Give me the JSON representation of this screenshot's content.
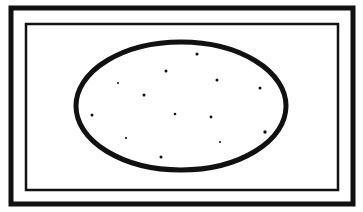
{
  "illustration": {
    "subject": "cracker-icon",
    "background": "#ffffff",
    "stroke_color": "#111111",
    "outer_frame": {
      "x": 11,
      "y": 8,
      "w": 342,
      "h": 196,
      "stroke": 5
    },
    "inner_frame": {
      "x": 26,
      "y": 24,
      "w": 312,
      "h": 166,
      "stroke": 2.5
    },
    "ellipse": {
      "cx": 181,
      "cy": 106,
      "rx": 105,
      "ry": 64,
      "stroke": 5
    },
    "dots": [
      {
        "x": 197,
        "y": 54,
        "r": 1.6
      },
      {
        "x": 166,
        "y": 71,
        "r": 1.5
      },
      {
        "x": 217,
        "y": 80,
        "r": 1.5
      },
      {
        "x": 118,
        "y": 83,
        "r": 1.0
      },
      {
        "x": 260,
        "y": 88,
        "r": 1.5
      },
      {
        "x": 144,
        "y": 95,
        "r": 1.5
      },
      {
        "x": 92,
        "y": 115,
        "r": 1.5
      },
      {
        "x": 175,
        "y": 114,
        "r": 1.3
      },
      {
        "x": 211,
        "y": 117,
        "r": 1.4
      },
      {
        "x": 265,
        "y": 132,
        "r": 1.7
      },
      {
        "x": 126,
        "y": 138,
        "r": 1.1
      },
      {
        "x": 220,
        "y": 142,
        "r": 1.0
      },
      {
        "x": 161,
        "y": 157,
        "r": 1.5
      }
    ]
  }
}
